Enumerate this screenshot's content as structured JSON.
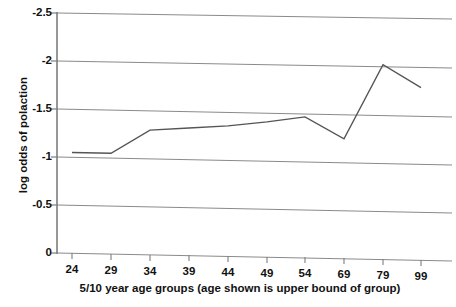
{
  "chart_data": {
    "type": "line",
    "title": "",
    "xlabel": "5/10 year age groups (age shown is upper bound of group)",
    "ylabel": "log odds of polaction",
    "categories": [
      "24",
      "29",
      "34",
      "39",
      "44",
      "49",
      "54",
      "69",
      "79",
      "99"
    ],
    "values": [
      -1.05,
      -1.05,
      -1.3,
      -1.33,
      -1.36,
      -1.41,
      -1.47,
      -1.25,
      -2.03,
      -1.8
    ],
    "series": [
      {
        "name": "log odds of polaction",
        "values": [
          -1.05,
          -1.05,
          -1.3,
          -1.33,
          -1.36,
          -1.41,
          -1.47,
          -1.25,
          -2.03,
          -1.8
        ]
      }
    ],
    "ytick_labels": [
      "-2.5",
      "-2",
      "-1.5",
      "-1",
      "-0.5",
      "0"
    ],
    "ytick_values": [
      -2.5,
      -2,
      -1.5,
      -1,
      -0.5,
      0
    ],
    "xtick_labels": [
      "24",
      "29",
      "34",
      "39",
      "44",
      "49",
      "54",
      "69",
      "79",
      "99"
    ],
    "ylim": [
      -2.5,
      0
    ],
    "y_axis_inverted": true,
    "grid": true,
    "grid_axis": "y",
    "legend": "none",
    "legend_position": "none",
    "line_color": "#555555",
    "grid_color": "#808080",
    "axis_color": "#808080",
    "background_color": "#ffffff",
    "markers": false,
    "annotations": []
  },
  "axes": {
    "y_title": "log odds of polaction",
    "x_title": "5/10 year age groups (age shown is upper bound of group)"
  }
}
